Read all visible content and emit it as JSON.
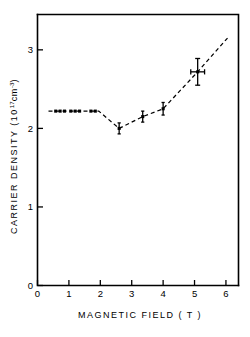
{
  "chart_data": {
    "type": "scatter",
    "title": "",
    "xlabel": "MAGNETIC FIELD ( T )",
    "ylabel": "CARRIER DENSITY (10",
    "ylabel_exp": "17",
    "ylabel_unit": "cm",
    "ylabel_unit_exp": "-3",
    "ylabel_close": ")",
    "xlim": [
      0,
      6.4
    ],
    "ylim": [
      0,
      3.45
    ],
    "xticks": [
      0,
      1,
      2,
      3,
      4,
      5,
      6
    ],
    "xtick_labels": [
      "0",
      "1",
      "2",
      "3",
      "4",
      "5",
      "6"
    ],
    "yticks": [
      0,
      1,
      2,
      3
    ],
    "ytick_labels": [
      "0",
      "1",
      "2",
      "3"
    ],
    "grid": false,
    "legend": null,
    "series": [
      {
        "name": "carrier density vs magnetic field",
        "marker": "filled-square",
        "line_style": "dashed",
        "points": [
          {
            "x": 0.58,
            "y": 2.22,
            "yerr": 0.0,
            "xerr": 0.0
          },
          {
            "x": 0.72,
            "y": 2.22,
            "yerr": 0.0,
            "xerr": 0.0
          },
          {
            "x": 0.86,
            "y": 2.22,
            "yerr": 0.0,
            "xerr": 0.0
          },
          {
            "x": 1.06,
            "y": 2.22,
            "yerr": 0.0,
            "xerr": 0.0
          },
          {
            "x": 1.2,
            "y": 2.22,
            "yerr": 0.0,
            "xerr": 0.0
          },
          {
            "x": 1.34,
            "y": 2.22,
            "yerr": 0.0,
            "xerr": 0.0
          },
          {
            "x": 1.7,
            "y": 2.22,
            "yerr": 0.0,
            "xerr": 0.0
          },
          {
            "x": 1.84,
            "y": 2.22,
            "yerr": 0.0,
            "xerr": 0.0
          },
          {
            "x": 2.6,
            "y": 2.0,
            "yerr": 0.07,
            "xerr": 0.0
          },
          {
            "x": 3.35,
            "y": 2.15,
            "yerr": 0.07,
            "xerr": 0.0
          },
          {
            "x": 4.0,
            "y": 2.25,
            "yerr": 0.08,
            "xerr": 0.0
          },
          {
            "x": 5.1,
            "y": 2.72,
            "yerr": 0.17,
            "xerr": 0.22
          }
        ]
      }
    ],
    "trend_line": [
      {
        "x": 0.35,
        "y": 2.22
      },
      {
        "x": 1.95,
        "y": 2.22
      },
      {
        "x": 2.6,
        "y": 2.0
      },
      {
        "x": 3.35,
        "y": 2.15
      },
      {
        "x": 4.0,
        "y": 2.25
      },
      {
        "x": 5.1,
        "y": 2.72
      },
      {
        "x": 6.05,
        "y": 3.15
      }
    ],
    "colors": {
      "axis": "#000000",
      "marker": "#000000",
      "line": "#000000",
      "background": "#ffffff"
    }
  }
}
